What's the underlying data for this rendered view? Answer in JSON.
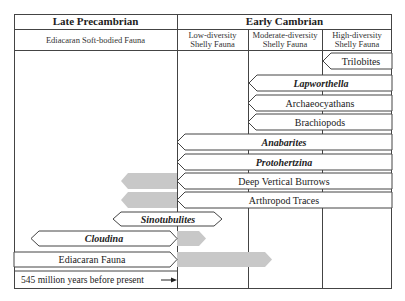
{
  "headers": {
    "era_left": "Late Precambrian",
    "era_right": "Early Cambrian",
    "sub_left": "Ediacaran Soft-bodied Fauna",
    "sub_low": [
      "Low-diversity",
      "Shelly Fauna"
    ],
    "sub_mod": [
      "Moderate-diversity",
      "Shelly Fauna"
    ],
    "sub_high": [
      "High-diversity",
      "Shelly Fauna"
    ]
  },
  "rows": [
    {
      "label": "Trilobites",
      "italic": false
    },
    {
      "label": "Lapworthella",
      "italic": true
    },
    {
      "label": "Archaeocyathans",
      "italic": false
    },
    {
      "label": "Brachiopods",
      "italic": false
    },
    {
      "label": "Anabarites",
      "italic": true
    },
    {
      "label": "Protohertzina",
      "italic": true
    },
    {
      "label": "Deep Vertical Burrows",
      "italic": false
    },
    {
      "label": "Arthropod Traces",
      "italic": false
    },
    {
      "label": "Sinotubulites",
      "italic": true
    },
    {
      "label": "Cloudina",
      "italic": true
    },
    {
      "label": "Ediacaran Fauna",
      "italic": false
    }
  ],
  "boundary_note": "545 million years before present",
  "colors": {
    "line": "#444444",
    "bar_fill": "#ffffff",
    "uncertain_fill": "#c8c8c8"
  }
}
